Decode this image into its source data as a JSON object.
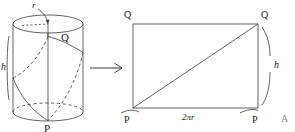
{
  "figure": {
    "stroke_color": "#3a3a3a",
    "background_color": "#ffffff",
    "text_color": "#1a1a1a"
  },
  "cylinder": {
    "radius_label": "r",
    "height_label": "h",
    "top_point_label": "Q",
    "bottom_point_label": "P"
  },
  "transform": {
    "arrow_glyph": "→"
  },
  "rectangle": {
    "top_left_label": "Q",
    "top_right_label": "Q",
    "bottom_left_label": "P",
    "bottom_right_label": "P",
    "width_label": "2πr",
    "height_label": "h"
  },
  "annotations": {
    "corner_mark": "A"
  }
}
